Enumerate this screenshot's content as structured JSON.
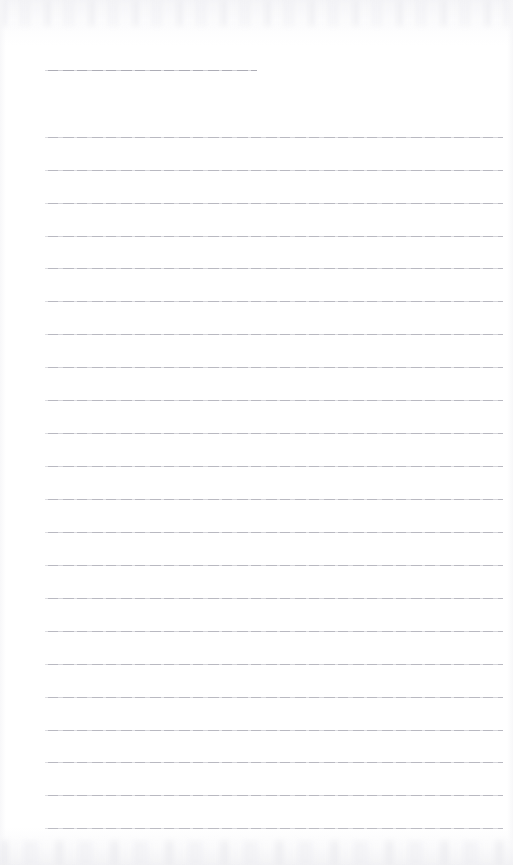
{
  "page": {
    "kind": "lined-paper-scan",
    "width": 513,
    "height": 865,
    "background_color": "#ffffff",
    "rule_color": "#b9b9c1",
    "header_rule_color": "#adadb6",
    "scan_edge_color": "#f0f0f3",
    "text_content": "",
    "line_count_total": 23,
    "long_line_count": 22,
    "short_line_count": 1
  },
  "rules": {
    "header": {
      "label": "header-rule",
      "x": 45,
      "y": 70,
      "width": 212
    },
    "body_geometry": {
      "x": 45,
      "width": 458,
      "first_y": 137,
      "spacing": 32.9
    },
    "body": [
      {
        "label": "ruled-line-1",
        "y": 137
      },
      {
        "label": "ruled-line-2",
        "y": 170
      },
      {
        "label": "ruled-line-3",
        "y": 203
      },
      {
        "label": "ruled-line-4",
        "y": 236
      },
      {
        "label": "ruled-line-5",
        "y": 268
      },
      {
        "label": "ruled-line-6",
        "y": 301
      },
      {
        "label": "ruled-line-7",
        "y": 334
      },
      {
        "label": "ruled-line-8",
        "y": 367
      },
      {
        "label": "ruled-line-9",
        "y": 400
      },
      {
        "label": "ruled-line-10",
        "y": 433
      },
      {
        "label": "ruled-line-11",
        "y": 466
      },
      {
        "label": "ruled-line-12",
        "y": 499
      },
      {
        "label": "ruled-line-13",
        "y": 532
      },
      {
        "label": "ruled-line-14",
        "y": 565
      },
      {
        "label": "ruled-line-15",
        "y": 598
      },
      {
        "label": "ruled-line-16",
        "y": 631
      },
      {
        "label": "ruled-line-17",
        "y": 664
      },
      {
        "label": "ruled-line-18",
        "y": 697
      },
      {
        "label": "ruled-line-19",
        "y": 730
      },
      {
        "label": "ruled-line-20",
        "y": 762
      },
      {
        "label": "ruled-line-21",
        "y": 795
      },
      {
        "label": "ruled-line-22",
        "y": 828
      }
    ]
  }
}
